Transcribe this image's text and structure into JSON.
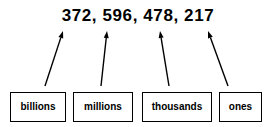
{
  "diagram": {
    "background_color": "#ffffff",
    "ink_color": "#000000",
    "width": 276,
    "height": 127
  },
  "number": {
    "text": "372, 596, 478, 217",
    "groups": [
      "372",
      "596",
      "478",
      "217"
    ],
    "separator": ","
  },
  "boxes": [
    {
      "label": "billions",
      "x": 10,
      "y": 92,
      "width": 56,
      "height": 30,
      "arrow": {
        "x1": 45,
        "y1": 86,
        "x2": 63,
        "y2": 31
      }
    },
    {
      "label": "millions",
      "x": 73,
      "y": 92,
      "width": 60,
      "height": 30,
      "arrow": {
        "x1": 101,
        "y1": 86,
        "x2": 107,
        "y2": 31
      }
    },
    {
      "label": "thousands",
      "x": 142,
      "y": 92,
      "width": 70,
      "height": 30,
      "arrow": {
        "x1": 169,
        "y1": 86,
        "x2": 160,
        "y2": 31
      }
    },
    {
      "label": "ones",
      "x": 219,
      "y": 92,
      "width": 43,
      "height": 30,
      "arrow": {
        "x1": 228,
        "y1": 86,
        "x2": 208,
        "y2": 31
      }
    }
  ],
  "arrow_style": {
    "stroke_width": 1.4,
    "head_length": 7,
    "head_width": 5,
    "color": "#000000"
  }
}
